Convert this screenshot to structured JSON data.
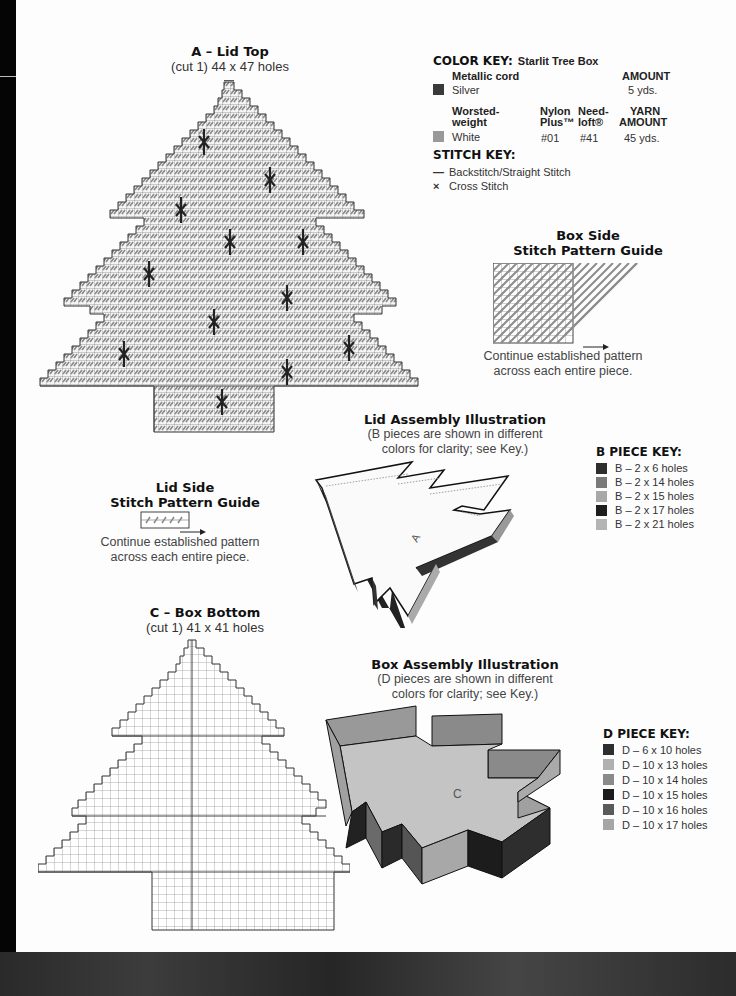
{
  "lid_top": {
    "title": "A – Lid Top",
    "subtitle": "(cut 1) 44 x 47 holes"
  },
  "color_key": {
    "heading": "COLOR KEY:",
    "project": "Starlit Tree Box",
    "metallic": {
      "header": "Metallic cord",
      "amount_header": "AMOUNT",
      "name": "Silver",
      "amount": "5 yds.",
      "color": "#3a3a3a"
    },
    "worsted": {
      "header_line1": "Worsted-",
      "header_line2": "weight",
      "nylon_line1": "Nylon",
      "nylon_line2": "Plus™",
      "needloft_line1": "Need-",
      "needloft_line2": "loft®",
      "yarn_line1": "YARN",
      "yarn_line2": "AMOUNT",
      "name": "White",
      "nylon_code": "#01",
      "needloft_code": "#41",
      "amount": "45 yds.",
      "color": "#999999"
    }
  },
  "stitch_key": {
    "heading": "STITCH KEY:",
    "items": [
      {
        "symbol": "—",
        "label": "Backstitch/Straight Stitch"
      },
      {
        "symbol": "×",
        "label": "Cross Stitch"
      }
    ]
  },
  "box_side_guide": {
    "title_line1": "Box Side",
    "title_line2": "Stitch Pattern Guide",
    "caption_line1": "Continue established pattern",
    "caption_line2": "across each entire piece."
  },
  "lid_assembly": {
    "title": "Lid Assembly Illustration",
    "caption_line1": "(B pieces are shown in different",
    "caption_line2": "colors for clarity; see Key.)",
    "piece_label": "A"
  },
  "b_piece_key": {
    "heading": "B PIECE KEY:",
    "items": [
      {
        "label": "B – 2 x 6 holes",
        "color": "#2e2e2e"
      },
      {
        "label": "B – 2 x 14 holes",
        "color": "#7a7a7a"
      },
      {
        "label": "B – 2 x 15 holes",
        "color": "#a8a8a8"
      },
      {
        "label": "B – 2 x 17 holes",
        "color": "#1e1e1e"
      },
      {
        "label": "B – 2 x 21 holes",
        "color": "#b4b4b4"
      }
    ]
  },
  "lid_side_guide": {
    "title_line1": "Lid Side",
    "title_line2": "Stitch Pattern Guide",
    "caption_line1": "Continue established pattern",
    "caption_line2": "across each entire piece."
  },
  "box_bottom": {
    "title": "C – Box Bottom",
    "subtitle": "(cut 1) 41 x 41 holes"
  },
  "box_assembly": {
    "title": "Box Assembly Illustration",
    "caption_line1": "(D pieces are shown in different",
    "caption_line2": "colors for clarity; see Key.)",
    "piece_label": "C"
  },
  "d_piece_key": {
    "heading": "D PIECE KEY:",
    "items": [
      {
        "label": "D – 6 x 10 holes",
        "color": "#2e2e2e"
      },
      {
        "label": "D – 10 x 13 holes",
        "color": "#b0b0b0"
      },
      {
        "label": "D – 10 x 14 holes",
        "color": "#8a8a8a"
      },
      {
        "label": "D – 10 x 15 holes",
        "color": "#1c1c1c"
      },
      {
        "label": "D – 10 x 16 holes",
        "color": "#5a5a5a"
      },
      {
        "label": "D – 10 x 17 holes",
        "color": "#a6a6a6"
      }
    ]
  }
}
